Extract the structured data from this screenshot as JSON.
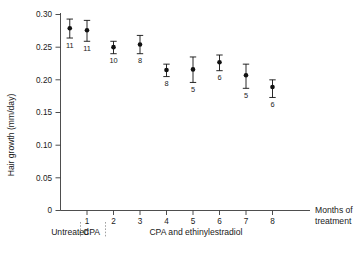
{
  "chart_data": {
    "type": "scatter",
    "title": "",
    "xlabel": "Months of treatment",
    "ylabel": "Hair growth (mm/day)",
    "ylim": [
      0,
      0.3
    ],
    "xlim": [
      0,
      8.6
    ],
    "grid": false,
    "legend_position": "none",
    "ytick_labels": [
      "0",
      "0.05",
      "0.10",
      "0.15",
      "0.20",
      "0.25",
      "0.30"
    ],
    "ytick_values": [
      0,
      0.05,
      0.1,
      0.15,
      0.2,
      0.25,
      0.3
    ],
    "xtick_labels": [
      "1",
      "2",
      "3",
      "4",
      "5",
      "6",
      "7",
      "8"
    ],
    "xtick_values": [
      1,
      2,
      3,
      4,
      5,
      6,
      7,
      8
    ],
    "error_type": "standard error",
    "x": [
      0.35,
      1,
      2,
      3,
      4,
      5,
      6,
      7,
      8
    ],
    "values": [
      0.279,
      0.276,
      0.25,
      0.254,
      0.215,
      0.216,
      0.227,
      0.207,
      0.189
    ],
    "err_upper": [
      0.293,
      0.291,
      0.259,
      0.268,
      0.224,
      0.235,
      0.238,
      0.224,
      0.2
    ],
    "err_lower": [
      0.264,
      0.259,
      0.24,
      0.24,
      0.205,
      0.196,
      0.214,
      0.187,
      0.173
    ],
    "point_labels": [
      "11",
      "11",
      "10",
      "8",
      "8",
      "5",
      "6",
      "5",
      "6"
    ],
    "point_label_meaning": "number of subjects",
    "annotations": [
      {
        "text": "Untreated",
        "x_start": 0,
        "x_end": 0.72
      },
      {
        "text": "CPA",
        "x_start": 0.72,
        "x_end": 1.62
      },
      {
        "text": "CPA and ethinylestradiol",
        "x_start": 1.62,
        "x_end": 8.6
      }
    ]
  },
  "axes": {
    "y_title": "Hair growth (mm/day)",
    "x_title_line1": "Months of",
    "x_title_line2": "treatment"
  }
}
